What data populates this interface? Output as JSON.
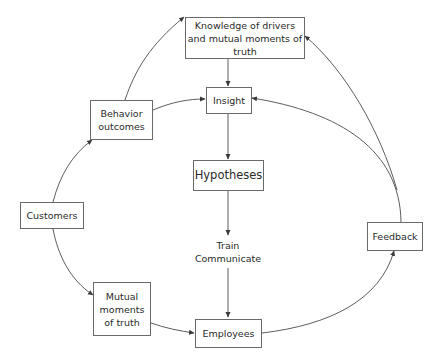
{
  "diagram": {
    "nodes": {
      "knowledge": {
        "label": "Knowledge of drivers\nand mutual moments of truth"
      },
      "insight": {
        "label": "Insight"
      },
      "hypotheses": {
        "label": "Hypotheses"
      },
      "train_communicate": {
        "label": "Train\nCommunicate"
      },
      "employees": {
        "label": "Employees"
      },
      "behavior_outcomes": {
        "label": "Behavior\noutcomes"
      },
      "customers": {
        "label": "Customers"
      },
      "mutual_moments": {
        "label": "Mutual\nmoments\nof truth"
      },
      "feedback": {
        "label": "Feedback"
      }
    },
    "edges": [
      {
        "from": "knowledge",
        "to": "insight"
      },
      {
        "from": "insight",
        "to": "hypotheses"
      },
      {
        "from": "hypotheses",
        "to": "train_communicate"
      },
      {
        "from": "train_communicate",
        "to": "employees"
      },
      {
        "from": "behavior_outcomes",
        "to": "knowledge"
      },
      {
        "from": "behavior_outcomes",
        "to": "insight"
      },
      {
        "from": "customers",
        "to": "behavior_outcomes"
      },
      {
        "from": "customers",
        "to": "mutual_moments",
        "bidirectional": true
      },
      {
        "from": "mutual_moments",
        "to": "employees",
        "bidirectional": true
      },
      {
        "from": "employees",
        "to": "feedback",
        "bidirectional": true
      },
      {
        "from": "feedback",
        "to": "insight"
      },
      {
        "from": "feedback",
        "to": "knowledge"
      }
    ],
    "colors": {
      "line": "#4a4a4a",
      "border": "#6a6a6a",
      "text": "#2a2a2a"
    }
  }
}
